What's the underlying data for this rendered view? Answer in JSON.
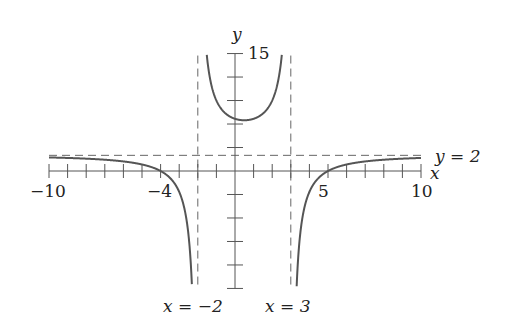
{
  "chart_data": {
    "type": "line",
    "title": "",
    "function": "f(x) = 2 - 28/((x+2)(x-3))",
    "xlabel": "x",
    "ylabel": "y",
    "xlim": [
      -10,
      10
    ],
    "ylim": [
      -15,
      15
    ],
    "x_tick_labels": [
      {
        "value": -10,
        "label": "−10"
      },
      {
        "value": -4,
        "label": "−4"
      },
      {
        "value": 5,
        "label": "5"
      },
      {
        "value": 10,
        "label": "10"
      }
    ],
    "y_tick_labels": [
      {
        "value": 15,
        "label": "15"
      }
    ],
    "x_tick_step": 1,
    "y_tick_step": 3,
    "asymptotes": {
      "vertical": [
        {
          "x": -2,
          "label": "x = −2"
        },
        {
          "x": 3,
          "label": "x = 3"
        }
      ],
      "horizontal": [
        {
          "y": 2,
          "label": "y = 2"
        }
      ]
    },
    "key_points": {
      "x_intercepts": [
        -4,
        5
      ],
      "local_min": {
        "x": 0.5,
        "y": 6.48
      },
      "y_intercept": 6.67
    },
    "grid": false,
    "legend": null
  },
  "labels": {
    "x_axis": "x",
    "y_axis": "y",
    "y_top": "15",
    "x_m10": "−10",
    "x_m4": "−4",
    "x_5": "5",
    "x_10": "10",
    "h_asym": "y = 2",
    "v_asym_left": "x = −2",
    "v_asym_right": "x = 3"
  },
  "colors": {
    "curve": "#555555",
    "axis": "#555555",
    "asymptote": "#666666"
  }
}
